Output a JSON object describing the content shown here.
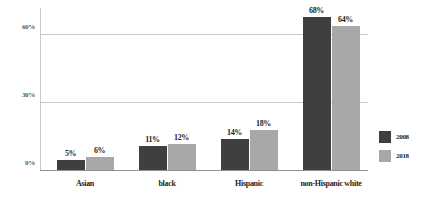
{
  "chart_data": {
    "type": "bar",
    "title": "",
    "subtitle": "",
    "xlabel": "",
    "ylabel": "",
    "categories": [
      "Asian",
      "black",
      "Hispanic",
      "non-Hispanic white"
    ],
    "series": [
      {
        "name": "2008",
        "color": "#3f3f3f",
        "values": [
          5,
          11,
          14,
          68
        ],
        "labels": [
          "5%",
          "11%",
          "14%",
          "68%"
        ]
      },
      {
        "name": "2018",
        "color": "#a8a8a8",
        "values": [
          6,
          12,
          18,
          64
        ],
        "labels": [
          "6%",
          "12%",
          "18%",
          "64%"
        ]
      }
    ],
    "ylim": [
      0,
      72
    ],
    "yticks": [
      0,
      30,
      60
    ],
    "ytick_labels": [
      "0%",
      "30%",
      "60%"
    ],
    "grid": true,
    "gridlines_at": [
      30,
      60
    ],
    "legend_position": "right",
    "value_labels": true,
    "orientation": "vertical",
    "grouping": "grouped"
  },
  "legend": {
    "items": [
      {
        "label": "2008",
        "color": "#3f3f3f"
      },
      {
        "label": "2018",
        "color": "#a8a8a8"
      }
    ]
  },
  "axis": {
    "y_ticks": [
      {
        "label": "60%",
        "value": 60
      },
      {
        "label": "30%",
        "value": 30
      },
      {
        "label": "0%",
        "value": 0
      }
    ]
  },
  "colors": {
    "series_2008": "#3f3f3f",
    "series_2018": "#a8a8a8",
    "gridline": "#c9c9c9",
    "baseline": "#8f8f8f",
    "text": "#1d1d1d",
    "tick_text": "#5a5a5a",
    "background": "#ffffff"
  }
}
